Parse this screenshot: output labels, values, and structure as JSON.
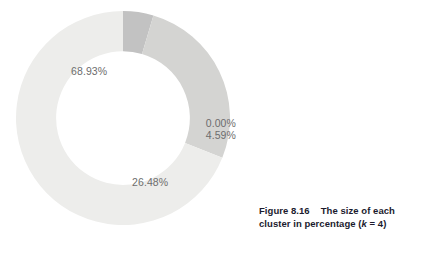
{
  "figure": {
    "caption_number": "Figure 8.16",
    "caption_text_1": "The size of each",
    "caption_text_2_pre": "cluster in percentage (",
    "caption_text_2_var": "k",
    "caption_text_2_post": " = 4)",
    "caption_full": "Figure 8.16   The size of each cluster in percentage (k = 4)"
  },
  "chart_data": {
    "type": "pie",
    "variant": "donut",
    "title": "",
    "subtitle": "",
    "xlabel": "",
    "ylabel": "",
    "grid": false,
    "legend_position": "none",
    "start_angle_deg": 0,
    "direction": "clockwise",
    "inner_radius_ratio": 0.625,
    "labels_shown_as": "percent",
    "categories": [
      "Cluster 1",
      "Cluster 2",
      "Cluster 3",
      "Cluster 4"
    ],
    "values": [
      0.0,
      4.59,
      26.48,
      68.93
    ],
    "value_labels": [
      "0.00%",
      "4.59%",
      "26.48%",
      "68.93%"
    ],
    "colors": [
      "#d0d0d0",
      "#c2c2c2",
      "#d4d4d2",
      "#ededeb"
    ],
    "slices": [
      {
        "name": "Cluster 1",
        "value": 0.0,
        "label": "0.00%",
        "color": "#c2c2c2",
        "start_deg": 0.0,
        "end_deg": 0.0
      },
      {
        "name": "Cluster 2",
        "value": 4.59,
        "label": "4.59%",
        "color": "#c2c2c2",
        "start_deg": 0.0,
        "end_deg": 16.524
      },
      {
        "name": "Cluster 3",
        "value": 26.48,
        "label": "26.48%",
        "color": "#d4d4d2",
        "start_deg": 16.524,
        "end_deg": 111.852
      },
      {
        "name": "Cluster 4",
        "value": 68.93,
        "label": "68.93%",
        "color": "#ededeb",
        "start_deg": 111.852,
        "end_deg": 360.0
      }
    ]
  },
  "labels": {
    "pct_68": "68.93%",
    "pct_26": "26.48%",
    "pct_0": "0.00%",
    "pct_4": "4.59%"
  }
}
